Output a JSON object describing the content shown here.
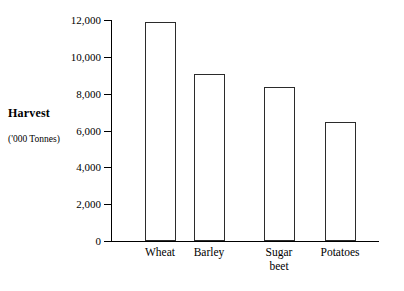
{
  "chart_data": {
    "type": "bar",
    "title": "",
    "subtitle": "",
    "xlabel": "",
    "ylabel": "Harvest",
    "ylabel_units": "('000 Tonnes)",
    "categories": [
      "Wheat",
      "Barley",
      "Sugar\nbeet",
      "Potatoes"
    ],
    "values": [
      11900,
      9050,
      8350,
      6450
    ],
    "ytick_labels": [
      "0",
      "2,000",
      "4,000",
      "6,000",
      "8,000",
      "10,000",
      "12,000"
    ],
    "ytick_values": [
      0,
      2000,
      4000,
      6000,
      8000,
      10000,
      12000
    ],
    "ylim": [
      0,
      12000
    ],
    "grid": false,
    "legend": false,
    "legend_position": "none",
    "bar_fill_color": "#ffffff",
    "bar_edge_color": "#2b2b2b",
    "axis_color": "#000000",
    "background_color": "#ffffff"
  }
}
